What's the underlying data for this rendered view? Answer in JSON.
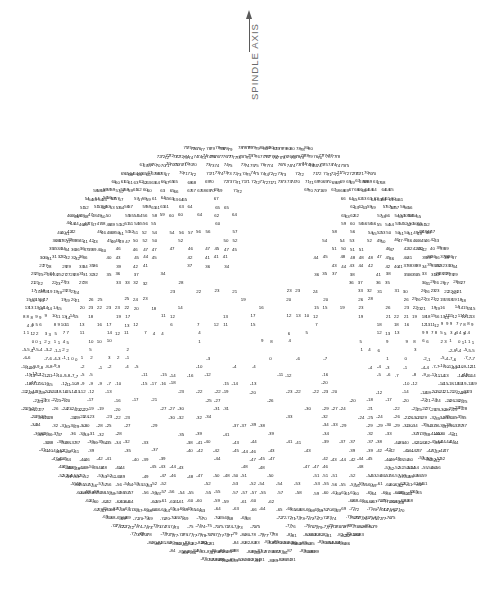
{
  "figure": {
    "background_color": "#ffffff",
    "ink_color": "#1a1a1a",
    "annotation_color": "#6a6a6a"
  },
  "axis_annotation": {
    "label": "SPINDLE AXIS",
    "arrow_icon": "arrow-up-icon",
    "arrow_direction": "up",
    "orientation": "vertical-rotated-90",
    "color": "#6a6a6a"
  },
  "plot": {
    "description": "Line-printer style numeric contour map printed on a circular disk region. Each plotted character cell carries a signed integer value; values are positive across the upper portion of the disk and become negative toward the lower portion.",
    "shape": "disk",
    "center_x": 247,
    "center_y": 352,
    "radius_x": 228,
    "radius_y": 212,
    "value_units": "unlabeled integer contour level",
    "value_range": [
      -97,
      97
    ],
    "notes": [
      "White interior notch near center-left (blank print region)",
      "White annulus gaps separating nested contour bands",
      "Dense overprinted two-digit values near the left and right rims"
    ]
  },
  "chart_data": {
    "type": "heatmap",
    "title": "",
    "subtitle": "",
    "xlabel": "",
    "ylabel": "",
    "annotations": [
      "SPINDLE AXIS"
    ],
    "grid": false,
    "legend": "none",
    "render": "numeric-text-cells",
    "xlim": [
      -1.0,
      1.0
    ],
    "ylim": [
      -1.0,
      1.0
    ],
    "value_range": [
      -97,
      97
    ],
    "cell_font_px": 4.4,
    "col_step": 9.0,
    "row_step": 8.4,
    "center": [
      247,
      352
    ],
    "radius": [
      228,
      212
    ],
    "field": {
      "form": "value = A0 + Ay*ny + Aswirl*ny*(1-nr^2) + Aring*cos(k*nr*PI) + Alobe*nx*ny",
      "A0": 0,
      "Ay": 86,
      "Aswirl": 10,
      "Aring": 5,
      "k": 3.1,
      "Alobe": 7
    },
    "blank_regions": [
      {
        "shape": "notch",
        "cx": 175,
        "cy": 352,
        "rx": 24,
        "ry": 20
      },
      {
        "shape": "notch",
        "cx": 338,
        "cy": 330,
        "rx": 22,
        "ry": 22
      },
      {
        "shape": "ring-gap",
        "r_inner": 0.3,
        "r_outer": 0.345,
        "angle_start": 200,
        "angle_end": 345
      },
      {
        "shape": "ring-gap",
        "r_inner": 0.55,
        "r_outer": 0.585,
        "angle_start": 205,
        "angle_end": 340
      },
      {
        "shape": "wedge",
        "angle_start": 58,
        "angle_end": 92,
        "r_inner": 0.24,
        "r_outer": 0.8
      }
    ],
    "sample_rows": [
      {
        "label": "top rim",
        "y_norm": 0.94,
        "values": [
          18,
          21,
          18,
          17,
          16,
          18,
          18,
          19,
          18
        ]
      },
      {
        "label": "upper",
        "y_norm": 0.88,
        "values": [
          19,
          12,
          16,
          11,
          15,
          11,
          11,
          11,
          11,
          19
        ]
      },
      {
        "label": "upper-mid",
        "y_norm": 0.8,
        "values": [
          1,
          1,
          1,
          1,
          1,
          1,
          1,
          1,
          1,
          0,
          3,
          3
        ]
      },
      {
        "label": "center-column",
        "y_norm": 0.08,
        "values": [
          16,
          13,
          10,
          8,
          5,
          2,
          0,
          -2,
          -5,
          -8
        ]
      },
      {
        "label": "center-grid-a",
        "y_norm": 0.12,
        "values": [
          18,
          18,
          18,
          18,
          18,
          18
        ]
      },
      {
        "label": "center-grid-b",
        "y_norm": 0.08,
        "values": [
          13,
          13,
          13,
          13,
          13,
          13,
          13
        ]
      },
      {
        "label": "center-grid-c",
        "y_norm": 0.05,
        "values": [
          10,
          10,
          10,
          10,
          10,
          10,
          10
        ]
      },
      {
        "label": "center-grid-d",
        "y_norm": 0.02,
        "values": [
          7,
          7,
          7,
          7,
          7,
          7,
          7
        ]
      },
      {
        "label": "center-grid-e",
        "y_norm": -0.01,
        "values": [
          1,
          1,
          1,
          1,
          1,
          1,
          1
        ]
      },
      {
        "label": "center-grid-f",
        "y_norm": -0.05,
        "values": [
          -4,
          -4,
          -4,
          -4,
          -4,
          -4,
          -4
        ]
      },
      {
        "label": "center-grid-g",
        "y_norm": -0.09,
        "values": [
          -11,
          -11,
          -11,
          -11,
          -11,
          -11
        ]
      },
      {
        "label": "center-grid-h",
        "y_norm": -0.12,
        "values": [
          -14,
          -14,
          -14,
          -14,
          -14,
          -14
        ]
      },
      {
        "label": "center-grid-i",
        "y_norm": -0.15,
        "values": [
          -17,
          -17,
          -17,
          -17,
          -17
        ]
      },
      {
        "label": "center-grid-j",
        "y_norm": -0.18,
        "values": [
          -20,
          -20,
          -20
        ]
      },
      {
        "label": "lower-arc-a",
        "y_norm": -0.26,
        "values": [
          -30,
          -30,
          -30,
          -33,
          -33,
          -35
        ]
      },
      {
        "label": "lower-arc-b",
        "y_norm": -0.3,
        "values": [
          -34,
          -34,
          -34,
          -34,
          -34,
          -34
        ]
      },
      {
        "label": "lower-arc-c",
        "y_norm": -0.44,
        "values": [
          -62,
          -62,
          -62,
          -62,
          -62,
          -63
        ]
      },
      {
        "label": "lower-arc-d",
        "y_norm": -0.58,
        "values": [
          -78,
          -78,
          -78,
          -78,
          -78,
          -78,
          -78
        ]
      },
      {
        "label": "lower-arc-e",
        "y_norm": -0.62,
        "values": [
          -79,
          -79,
          -79,
          -79,
          -79,
          -79,
          -70
        ]
      },
      {
        "label": "lower-arc-f",
        "y_norm": -0.7,
        "values": [
          -85,
          -85,
          -85,
          -85
        ]
      },
      {
        "label": "bottom-zero-row",
        "y_norm": -0.82,
        "values": [
          0,
          0,
          0,
          0,
          0,
          0,
          0,
          0,
          -1
        ]
      },
      {
        "label": "bottom-a",
        "y_norm": -0.86,
        "values": [
          -4,
          -4,
          -4,
          -1,
          -2,
          -4,
          -4,
          -4
        ]
      },
      {
        "label": "bottom-b",
        "y_norm": -0.89,
        "values": [
          -7,
          -7,
          -7,
          -7,
          -7,
          -7,
          -7,
          -7
        ]
      },
      {
        "label": "bottom-c",
        "y_norm": -0.93,
        "values": [
          -10,
          -11,
          -13,
          -11,
          -11,
          -12,
          -13,
          -15
        ]
      },
      {
        "label": "bottom-rim",
        "y_norm": -0.97,
        "values": [
          -16,
          -16,
          -17,
          -18,
          -18,
          -18,
          -18,
          -21,
          -21
        ]
      }
    ],
    "left_rim_values": [
      97,
      95,
      92,
      90,
      88,
      85,
      83,
      80,
      77,
      74,
      71,
      68,
      65,
      62
    ],
    "right_rim_values": [
      24,
      20,
      17,
      14,
      11,
      8,
      5,
      1,
      -1,
      -4,
      -7,
      -11,
      -14,
      -17
    ]
  }
}
